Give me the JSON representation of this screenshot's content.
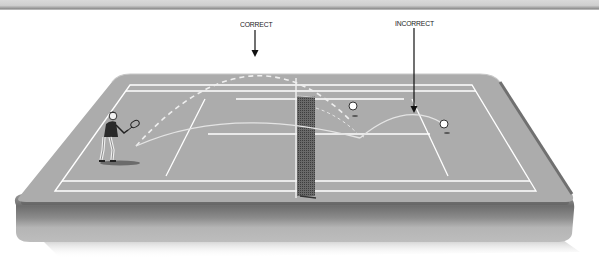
{
  "diagram": {
    "labels": {
      "correct": "CORRECT",
      "incorrect": "INCORRECT"
    },
    "colors": {
      "background": "#ffffff",
      "court_surface": "#a9a9a9",
      "court_lines": "#ffffff",
      "slab_edge": "#b4b4b4",
      "slab_shadow": "#6e6e6e",
      "net": "#555555",
      "arrow": "#111111",
      "trajectory_correct": "#e8e8e8",
      "trajectory_incorrect": "#e0e0e0"
    }
  }
}
